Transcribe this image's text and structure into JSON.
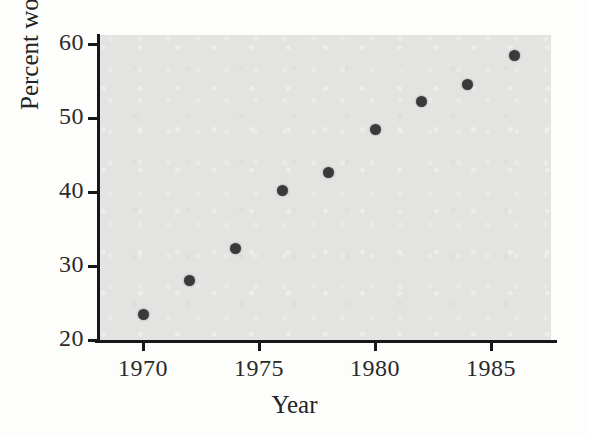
{
  "chart_data": {
    "type": "scatter",
    "title": "",
    "xlabel": "Year",
    "ylabel": "Percent women",
    "xlim": [
      1968.1,
      1987.6
    ],
    "ylim": [
      20,
      61.4
    ],
    "grid": false,
    "legend": null,
    "x": [
      1970,
      1972,
      1974,
      1976,
      1978,
      1980,
      1982,
      1984,
      1986
    ],
    "values": [
      23.4,
      28.0,
      32.4,
      40.2,
      42.7,
      48.4,
      52.2,
      54.5,
      58.4
    ],
    "points": [
      {
        "x": 1970,
        "y": 23.4
      },
      {
        "x": 1972,
        "y": 28.0
      },
      {
        "x": 1974,
        "y": 32.4
      },
      {
        "x": 1976,
        "y": 40.2
      },
      {
        "x": 1978,
        "y": 42.7
      },
      {
        "x": 1980,
        "y": 48.4
      },
      {
        "x": 1982,
        "y": 52.2
      },
      {
        "x": 1984,
        "y": 54.5
      },
      {
        "x": 1986,
        "y": 58.4
      }
    ],
    "xticks": [
      1970,
      1975,
      1980,
      1985
    ],
    "xtick_labels": [
      "1970",
      "1975",
      "1980",
      "1985"
    ],
    "yticks": [
      20,
      30,
      40,
      50,
      60
    ],
    "ytick_labels": [
      "20",
      "30",
      "40",
      "50",
      "60"
    ],
    "marker": "filled-circle",
    "marker_color": "#3a3a3a",
    "plot_background": "#e3e3e1",
    "axis_color": "#171717"
  },
  "axes": {
    "x_title": "Year",
    "y_title": "Percent women"
  }
}
